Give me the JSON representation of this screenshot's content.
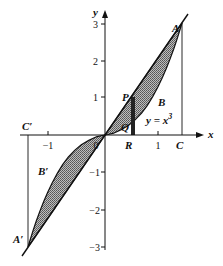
{
  "diagram": {
    "axes": {
      "x_label": "x",
      "y_label": "y"
    },
    "x_ticks": [
      {
        "value": -1,
        "label": "−1"
      },
      {
        "value": 0,
        "label": "0"
      },
      {
        "value": 1,
        "label": "1"
      }
    ],
    "y_ticks": [
      {
        "value": 3,
        "label": "3"
      },
      {
        "value": 2,
        "label": "2"
      },
      {
        "value": 1,
        "label": "1"
      },
      {
        "value": -1,
        "label": "−1"
      },
      {
        "value": -2,
        "label": "−2"
      },
      {
        "value": -3,
        "label": "−3"
      }
    ],
    "curve_label": "y = x",
    "curve_exponent": "3",
    "points": {
      "A": "A",
      "A_prime": "A′",
      "B": "B",
      "B_prime": "B′",
      "C": "C",
      "C_prime": "C′",
      "P": "P",
      "Q": "Q",
      "R": "R",
      "O": "0"
    },
    "colors": {
      "line": "#111111",
      "shade": "#8a8a8a",
      "background": "#ffffff"
    }
  }
}
